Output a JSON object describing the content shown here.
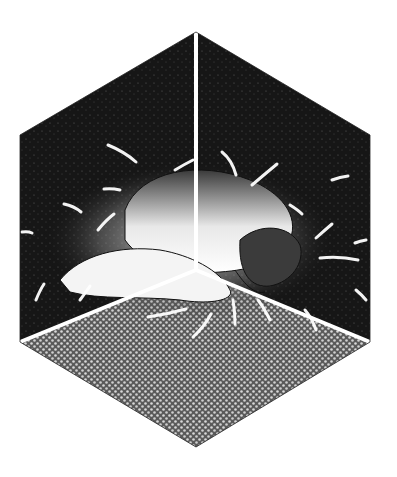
{
  "image": {
    "description": "Manga-style illustration: a figure curled up in fetal position inside the corner of a hexagonal isometric room (cube corner view) with dark walls and stippled floor, surrounded by white motion/impact streaks",
    "width": 397,
    "height": 477
  },
  "geometry": {
    "hexagon": [
      [
        196,
        32
      ],
      [
        370,
        135
      ],
      [
        370,
        342
      ],
      [
        196,
        447
      ],
      [
        20,
        342
      ],
      [
        20,
        135
      ]
    ],
    "corner_center": [
      196,
      270
    ]
  },
  "colors": {
    "background": "#ffffff",
    "wall_dark": "#1a1a1a",
    "floor_gray": "#7a7a7a",
    "divider": "#ffffff",
    "figure_light": "#f2f2f2",
    "outline": "#111111"
  }
}
